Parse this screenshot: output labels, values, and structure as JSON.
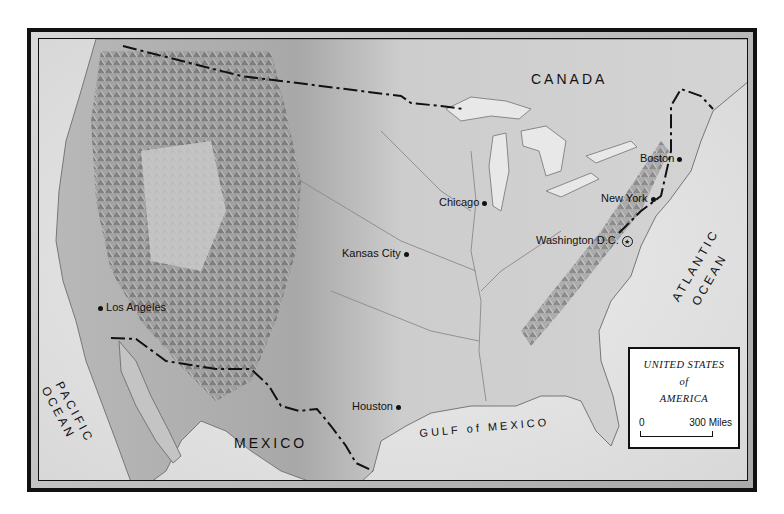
{
  "map": {
    "title_lines": [
      "UNITED STATES",
      "of",
      "AMERICA"
    ],
    "scale": {
      "start": "0",
      "end": "300 Miles"
    },
    "regions": {
      "canada": "CANADA",
      "mexico": "MEXICO"
    },
    "waters": {
      "pacific": [
        "PACIFIC",
        "OCEAN"
      ],
      "atlantic": [
        "ATLANTIC",
        "OCEAN"
      ],
      "gulf": "GULF of MEXICO"
    },
    "cities": [
      {
        "name": "Boston",
        "marker": "dot"
      },
      {
        "name": "Chicago",
        "marker": "dot"
      },
      {
        "name": "New York",
        "marker": "dot"
      },
      {
        "name": "Washington D.C.",
        "marker": "capital-star"
      },
      {
        "name": "Kansas City",
        "marker": "dot"
      },
      {
        "name": "Los Angeles",
        "marker": "dot"
      },
      {
        "name": "Houston",
        "marker": "dot"
      }
    ],
    "colors": {
      "frame": "#111111",
      "land": "#cfcfcf",
      "water": "#e6e6e6",
      "border_line": "#111111"
    }
  }
}
